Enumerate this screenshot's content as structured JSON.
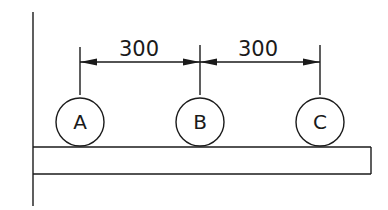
{
  "diagram": {
    "type": "engineering-dimension-drawing",
    "nodes": [
      {
        "label": "A",
        "cx": 80,
        "cy": 119
      },
      {
        "label": "B",
        "cx": 200,
        "cy": 119
      },
      {
        "label": "C",
        "cx": 320,
        "cy": 119
      }
    ],
    "dimensions": [
      {
        "from": "A",
        "to": "B",
        "value": "300"
      },
      {
        "from": "B",
        "to": "C",
        "value": "300"
      }
    ],
    "labels": {
      "node_a": "A",
      "node_b": "B",
      "node_c": "C",
      "dim_ab": "300",
      "dim_bc": "300"
    },
    "colors": {
      "line": "#1a1a1a",
      "background": "#ffffff"
    }
  }
}
